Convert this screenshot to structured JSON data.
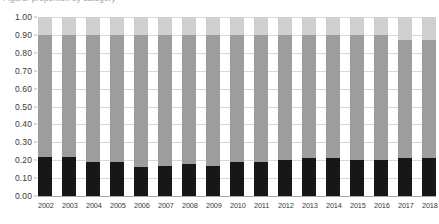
{
  "title": {
    "text": "Figure: proportion by category",
    "visible_partial": true
  },
  "y_axis": {
    "ticks": [
      "1.00",
      "0.90",
      "0.80",
      "0.70",
      "0.60",
      "0.50",
      "0.40",
      "0.30",
      "0.20",
      "0.10",
      "0.00"
    ]
  },
  "x_axis": {
    "ticks": [
      "2002",
      "2003",
      "2004",
      "2005",
      "2006",
      "2007",
      "2008",
      "2009",
      "2010",
      "2011",
      "2012",
      "2013",
      "2014",
      "2015",
      "2016",
      "2017",
      "2018"
    ]
  },
  "colors": {
    "segment_bottom": "#171717",
    "segment_middle": "#9d9d9d",
    "segment_top": "#cfcfcf",
    "gridline": "#d8d8d8",
    "axis_line": "#a9a9a9",
    "background": "#ffffff",
    "text": "#3a3a3a"
  },
  "chart_data": {
    "type": "bar",
    "stacked": true,
    "normalized": true,
    "title": "Figure: proportion by category",
    "xlabel": "",
    "ylabel": "",
    "ylim": [
      0,
      1
    ],
    "ytick_interval": 0.1,
    "grid": true,
    "legend": "none",
    "categories": [
      "2002",
      "2003",
      "2004",
      "2005",
      "2006",
      "2007",
      "2008",
      "2009",
      "2010",
      "2011",
      "2012",
      "2013",
      "2014",
      "2015",
      "2016",
      "2017",
      "2018"
    ],
    "series": [
      {
        "name": "bottom-segment",
        "color": "#171717",
        "values": [
          0.22,
          0.22,
          0.19,
          0.19,
          0.16,
          0.17,
          0.18,
          0.17,
          0.19,
          0.19,
          0.2,
          0.21,
          0.21,
          0.2,
          0.2,
          0.21,
          0.21
        ]
      },
      {
        "name": "middle-segment",
        "color": "#9d9d9d",
        "values": [
          0.68,
          0.68,
          0.71,
          0.71,
          0.74,
          0.73,
          0.72,
          0.73,
          0.71,
          0.71,
          0.7,
          0.69,
          0.69,
          0.7,
          0.7,
          0.66,
          0.66
        ]
      },
      {
        "name": "top-segment",
        "color": "#cfcfcf",
        "values": [
          0.1,
          0.1,
          0.1,
          0.1,
          0.1,
          0.1,
          0.1,
          0.1,
          0.1,
          0.1,
          0.1,
          0.1,
          0.1,
          0.1,
          0.1,
          0.13,
          0.13
        ]
      }
    ],
    "segment_tops": {
      "bottom_cumulative": [
        0.22,
        0.22,
        0.19,
        0.19,
        0.16,
        0.17,
        0.18,
        0.17,
        0.19,
        0.19,
        0.2,
        0.21,
        0.21,
        0.2,
        0.2,
        0.21,
        0.21
      ],
      "middle_cumulative": [
        0.9,
        0.9,
        0.9,
        0.9,
        0.9,
        0.9,
        0.9,
        0.9,
        0.9,
        0.9,
        0.9,
        0.9,
        0.9,
        0.9,
        0.9,
        0.87,
        0.87
      ]
    }
  }
}
